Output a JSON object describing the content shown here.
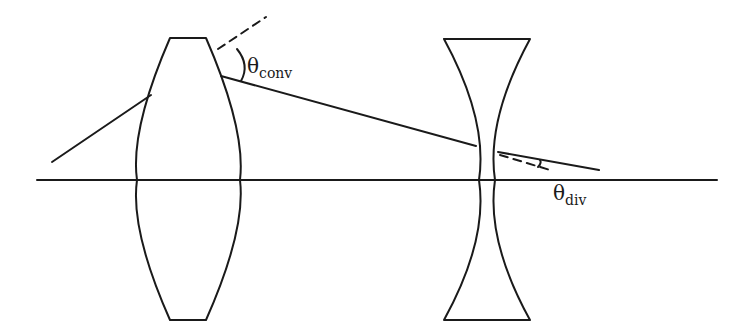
{
  "diagram": {
    "line_color": "#1a1a1a",
    "background": "#ffffff",
    "labels": {
      "theta_conv": {
        "symbol": "θ",
        "subscript": "conv"
      },
      "theta_div": {
        "symbol": "θ",
        "subscript": "div"
      }
    },
    "elements": [
      "optical-axis",
      "converging-lens",
      "diverging-lens",
      "incident-ray",
      "refracted-ray",
      "exit-ray",
      "normal-line-conv",
      "normal-line-div",
      "angle-arc-conv",
      "angle-arc-div"
    ]
  }
}
